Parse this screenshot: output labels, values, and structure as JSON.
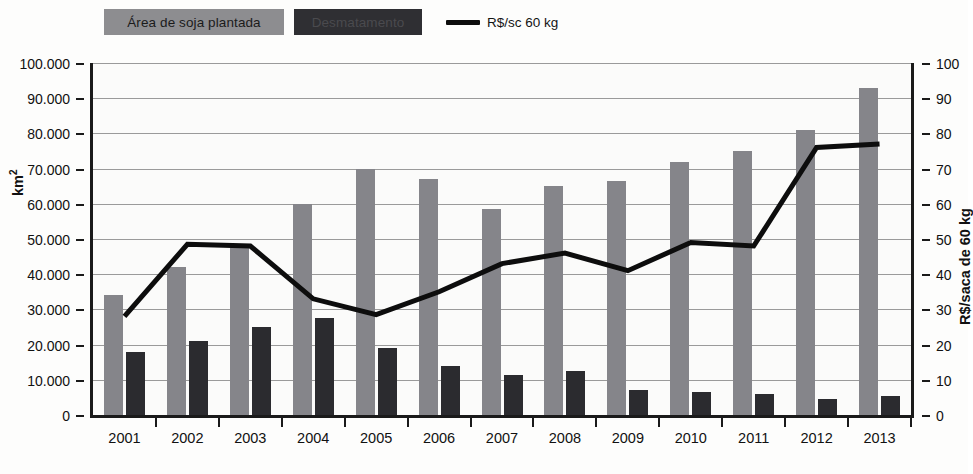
{
  "legend": {
    "soja_label": "Área de soja plantada",
    "desmatamento_label": "Desmatamento",
    "line_label": "R$/sc 60 kg",
    "soja_color": "#8d8d90",
    "desmatamento_color": "#2f2f33",
    "line_color": "#0d0d0d"
  },
  "axes": {
    "left_title": "km²",
    "right_title": "R$/saca de 60 kg",
    "left_ticks": [
      "0",
      "10.000",
      "20.000",
      "30.000",
      "40.000",
      "50.000",
      "60.000",
      "70.000",
      "80.000",
      "90.000",
      "100.000"
    ],
    "right_ticks": [
      "0",
      "10",
      "20",
      "30",
      "40",
      "50",
      "60",
      "70",
      "80",
      "90",
      "100"
    ]
  },
  "chart_data": {
    "type": "bar",
    "title": "",
    "xlabel": "",
    "ylabel": "km²",
    "ylabel_right": "R$/saca de 60 kg",
    "ylim": [
      0,
      100000
    ],
    "ylim_right": [
      0,
      100
    ],
    "grid": true,
    "legend_position": "top-left",
    "categories": [
      "2001",
      "2002",
      "2003",
      "2004",
      "2005",
      "2006",
      "2007",
      "2008",
      "2009",
      "2010",
      "2011",
      "2012",
      "2013"
    ],
    "series": [
      {
        "name": "Área de soja plantada",
        "type": "bar",
        "axis": "left",
        "unit": "km²",
        "color": "#85858a",
        "values": [
          34000,
          42000,
          48000,
          60000,
          70000,
          67000,
          58500,
          65000,
          66500,
          72000,
          75000,
          81000,
          93000
        ]
      },
      {
        "name": "Desmatamento",
        "type": "bar",
        "axis": "left",
        "unit": "km²",
        "color": "#2b2b2f",
        "values": [
          18000,
          21000,
          25000,
          27500,
          19000,
          14000,
          11500,
          12500,
          7000,
          6500,
          6000,
          4500,
          5500
        ]
      },
      {
        "name": "R$/sc 60 kg",
        "type": "line",
        "axis": "right",
        "unit": "R$/saca de 60 kg",
        "color": "#0d0d0d",
        "values": [
          28,
          48.5,
          48,
          33,
          28.5,
          35,
          43,
          46,
          41,
          49,
          48,
          76,
          77
        ]
      }
    ]
  }
}
